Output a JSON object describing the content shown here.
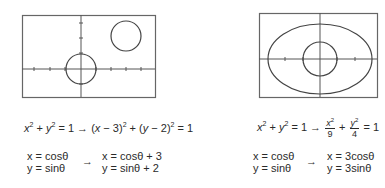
{
  "figures": [
    {
      "id": "translation",
      "graph": {
        "frame": {
          "x": 22,
          "y": 15,
          "w": 133,
          "h": 82
        },
        "axes": {
          "origin_x": 81,
          "origin_y": 69
        },
        "shapes": [
          {
            "type": "circle",
            "cx": 81,
            "cy": 69,
            "r": 15,
            "label": "unit circle"
          },
          {
            "type": "circle",
            "cx": 126,
            "cy": 36,
            "r": 15,
            "label": "translated circle"
          }
        ]
      },
      "equation": {
        "lhs": "x² + y² = 1",
        "arrow": "→",
        "rhs": "(x − 3)² + (y − 2)² = 1"
      },
      "parametric": {
        "original": [
          "x = cosθ",
          "y = sinθ"
        ],
        "arrow": "→",
        "transformed": [
          "x = cosθ + 3",
          "y = sinθ + 2"
        ]
      }
    },
    {
      "id": "scaling",
      "graph": {
        "frame": {
          "x": 259,
          "y": 13,
          "w": 118,
          "h": 84
        },
        "axes": {
          "origin_x": 320,
          "origin_y": 59
        },
        "shapes": [
          {
            "type": "ellipse",
            "cx": 320,
            "cy": 59,
            "rx": 52,
            "ry": 35,
            "label": "ellipse"
          },
          {
            "type": "circle",
            "cx": 320,
            "cy": 59,
            "r": 17,
            "label": "unit circle"
          }
        ]
      },
      "equation": {
        "lhs": "x² + y² = 1",
        "arrow": "→",
        "rhs_frac1": {
          "num": "x²",
          "den": "9"
        },
        "plus": "+",
        "rhs_frac2": {
          "num": "y²",
          "den": "4"
        },
        "rhs_tail": "= 1"
      },
      "parametric": {
        "original": [
          "x = cosθ",
          "y = sinθ"
        ],
        "arrow": "→",
        "transformed": [
          "x = 3cosθ",
          "y = 3sinθ"
        ]
      }
    }
  ],
  "colors": {
    "line": "#555555",
    "text": "#2a2a2a"
  }
}
